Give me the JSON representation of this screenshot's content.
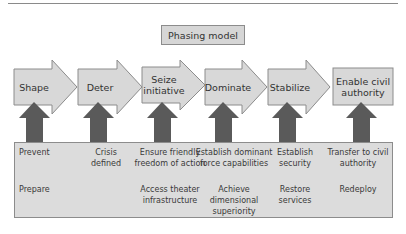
{
  "title": "Phasing model",
  "phases": [
    {
      "label": "Shape"
    },
    {
      "label": "Deter"
    },
    {
      "label": "Seize initiative"
    },
    {
      "label": "Dominate"
    },
    {
      "label": "Stabilize"
    },
    {
      "label": "Enable civil authority"
    }
  ],
  "activities": {
    "row1": [
      "Prevent",
      "Crisis defined",
      "Ensure friendly freedom of action",
      "Establish dominant force capabilities",
      "Establish security",
      "Transfer to civil authority"
    ],
    "row2": [
      "Prepare",
      "",
      "Access theater infrastructure",
      "Achieve dimensional superiority",
      "Restore services",
      "Redeploy"
    ]
  },
  "colors": {
    "phase_fill": "#d8d8d8",
    "phase_stroke": "#8c8c8c",
    "up_arrow": "#5a5a5a",
    "box_fill": "#dcdcdc"
  }
}
